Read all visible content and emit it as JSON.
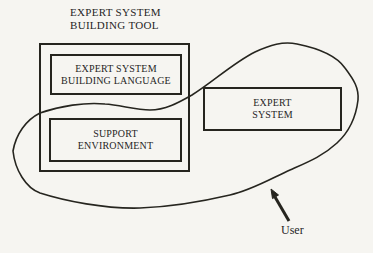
{
  "diagram": {
    "title": {
      "line1": "EXPERT SYSTEM",
      "line2": "BUILDING TOOL"
    },
    "boxes": {
      "building_language": {
        "line1": "EXPERT SYSTEM",
        "line2": "BUILDING LANGUAGE"
      },
      "support_environment": {
        "line1": "SUPPORT",
        "line2": "ENVIRONMENT"
      },
      "expert_system": {
        "line1": "EXPERT",
        "line2": "SYSTEM"
      }
    },
    "annotations": {
      "user_label": "User"
    },
    "colors": {
      "paper": "#f6f5f1",
      "ink": "#26251f"
    }
  }
}
